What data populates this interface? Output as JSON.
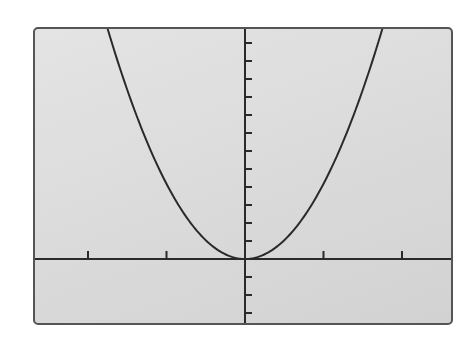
{
  "chart_data": {
    "type": "line",
    "title": "",
    "xlabel": "",
    "ylabel": "",
    "axes_labeled": false,
    "grid": false,
    "legend": null,
    "series": [
      {
        "name": "parabola",
        "shape": "upward parabola, vertex at origin",
        "vertex": [
          0,
          0
        ],
        "measured_points_tick_units": [
          {
            "x": -1.78,
            "y": 12.7,
            "note": "left branch exits top of window"
          },
          {
            "x": 0,
            "y": 0,
            "note": "vertex, tangent to x-axis"
          },
          {
            "x": 1.71,
            "y": 12.7,
            "note": "right branch exits top of window"
          }
        ]
      }
    ],
    "x_ticks": {
      "count_left": 2,
      "count_right": 2,
      "labels": []
    },
    "y_ticks": {
      "count_above": 12,
      "count_below": 3,
      "labels": []
    },
    "window_tick_units": {
      "xmin": -2.65,
      "xmax": 2.65,
      "ymin": -3.8,
      "ymax": 12.8
    }
  },
  "style": {
    "screen_background": "#dadada",
    "frame_color": "#555555",
    "axis_color": "#2a2a2a",
    "curve_color": "#2a2a2a"
  }
}
